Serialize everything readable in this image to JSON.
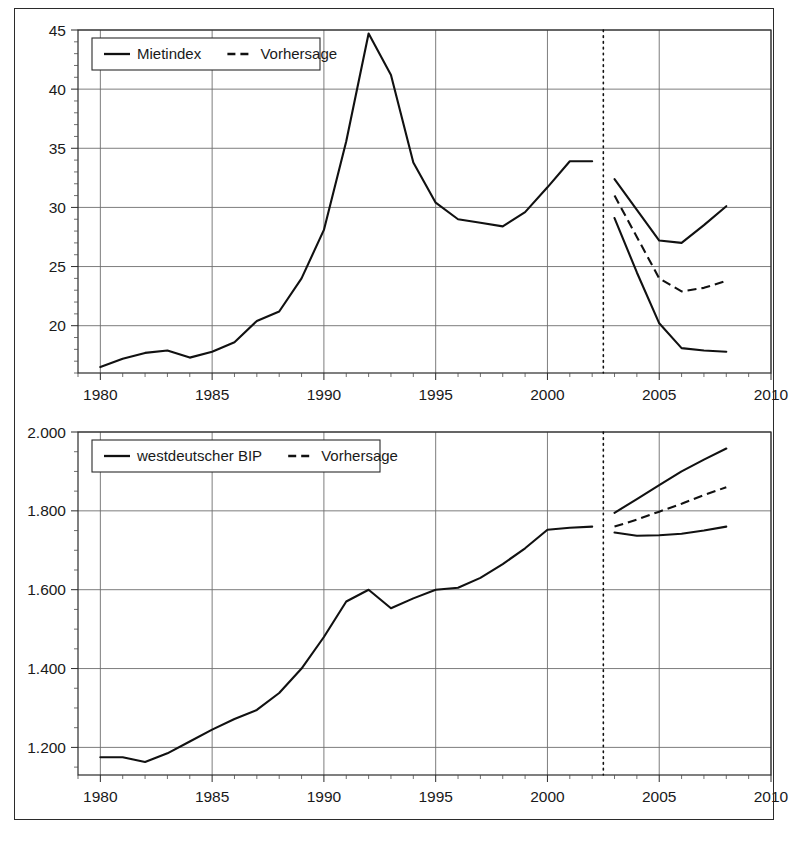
{
  "figure": {
    "frame_color": "#2b2b2b",
    "background": "#ffffff",
    "line_color": "#111111",
    "grid_color": "#6e6e6e"
  },
  "chart_data": [
    {
      "id": "mietindex",
      "type": "line",
      "title": "",
      "xlabel": "",
      "ylabel": "",
      "xlim": [
        1979.0,
        2010.0
      ],
      "ylim": [
        16.0,
        45.0
      ],
      "xticks": [
        1980,
        1985,
        1990,
        1995,
        2000,
        2005,
        2010
      ],
      "xtick_labels": [
        "1980",
        "1985",
        "1990",
        "1995",
        "2000",
        "2005",
        "2010"
      ],
      "yticks": [
        20,
        25,
        30,
        35,
        40,
        45
      ],
      "ytick_labels": [
        "20",
        "25",
        "30",
        "35",
        "40",
        "45"
      ],
      "y_minor_step": 1,
      "x_minor_step": 1,
      "grid": true,
      "legend": {
        "position": "top-left",
        "entries": [
          {
            "label": "Mietindex",
            "style": "solid"
          },
          {
            "label": "Vorhersage",
            "style": "dashed"
          }
        ]
      },
      "forecast_divider_x": 2002.5,
      "series": [
        {
          "name": "Mietindex",
          "style": "solid",
          "x": [
            1980,
            1981,
            1982,
            1983,
            1984,
            1985,
            1986,
            1987,
            1988,
            1989,
            1990,
            1991,
            1992,
            1993,
            1994,
            1995,
            1996,
            1997,
            1998,
            1999,
            2000,
            2001,
            2002
          ],
          "values": [
            16.5,
            17.2,
            17.7,
            17.9,
            17.3,
            17.8,
            18.6,
            20.4,
            21.2,
            24.0,
            28.1,
            35.6,
            44.7,
            41.2,
            33.8,
            30.4,
            29.0,
            28.7,
            28.4,
            29.6,
            31.7,
            33.9,
            33.9
          ]
        },
        {
          "name": "Vorhersage oberes Szenario",
          "style": "solid",
          "x": [
            2003,
            2004,
            2005,
            2006,
            2007,
            2008
          ],
          "values": [
            32.4,
            29.8,
            27.2,
            27.0,
            28.5,
            30.1
          ]
        },
        {
          "name": "Vorhersage mittleres Szenario",
          "style": "dashed",
          "x": [
            2003,
            2004,
            2005,
            2006,
            2007,
            2008
          ],
          "values": [
            31.0,
            27.5,
            24.0,
            22.9,
            23.2,
            23.8
          ]
        },
        {
          "name": "Vorhersage unteres Szenario",
          "style": "solid",
          "x": [
            2003,
            2004,
            2005,
            2006,
            2007,
            2008
          ],
          "values": [
            29.1,
            24.5,
            20.2,
            18.1,
            17.9,
            17.8
          ]
        }
      ]
    },
    {
      "id": "westdeutscher-bip",
      "type": "line",
      "title": "",
      "xlabel": "",
      "ylabel": "",
      "xlim": [
        1979.0,
        2010.0
      ],
      "ylim": [
        1130,
        2000
      ],
      "xticks": [
        1980,
        1985,
        1990,
        1995,
        2000,
        2005,
        2010
      ],
      "xtick_labels": [
        "1980",
        "1985",
        "1990",
        "1995",
        "2000",
        "2005",
        "2010"
      ],
      "yticks": [
        1200,
        1400,
        1600,
        1800,
        2000
      ],
      "ytick_labels": [
        "1.200",
        "1.400",
        "1.600",
        "1.800",
        "2.000"
      ],
      "y_minor_step": 50,
      "x_minor_step": 1,
      "grid": true,
      "legend": {
        "position": "top-left",
        "entries": [
          {
            "label": "westdeutscher BIP",
            "style": "solid"
          },
          {
            "label": "Vorhersage",
            "style": "dashed"
          }
        ]
      },
      "forecast_divider_x": 2002.5,
      "series": [
        {
          "name": "westdeutscher BIP",
          "style": "solid",
          "x": [
            1980,
            1981,
            1982,
            1983,
            1984,
            1985,
            1986,
            1987,
            1988,
            1989,
            1990,
            1991,
            1992,
            1993,
            1994,
            1995,
            1996,
            1997,
            1998,
            1999,
            2000,
            2001,
            2002
          ],
          "values": [
            1175,
            1175,
            1163,
            1185,
            1215,
            1245,
            1272,
            1295,
            1338,
            1400,
            1480,
            1570,
            1600,
            1553,
            1578,
            1600,
            1605,
            1630,
            1665,
            1705,
            1752,
            1757,
            1760
          ]
        },
        {
          "name": "Vorhersage oberes Szenario",
          "style": "solid",
          "x": [
            2003,
            2004,
            2005,
            2006,
            2007,
            2008
          ],
          "values": [
            1795,
            1830,
            1865,
            1900,
            1930,
            1958
          ]
        },
        {
          "name": "Vorhersage mittleres Szenario",
          "style": "dashed",
          "x": [
            2003,
            2004,
            2005,
            2006,
            2007,
            2008
          ],
          "values": [
            1760,
            1778,
            1798,
            1818,
            1840,
            1860
          ]
        },
        {
          "name": "Vorhersage unteres Szenario",
          "style": "solid",
          "x": [
            2003,
            2004,
            2005,
            2006,
            2007,
            2008
          ],
          "values": [
            1745,
            1737,
            1738,
            1742,
            1750,
            1760
          ]
        }
      ]
    }
  ]
}
